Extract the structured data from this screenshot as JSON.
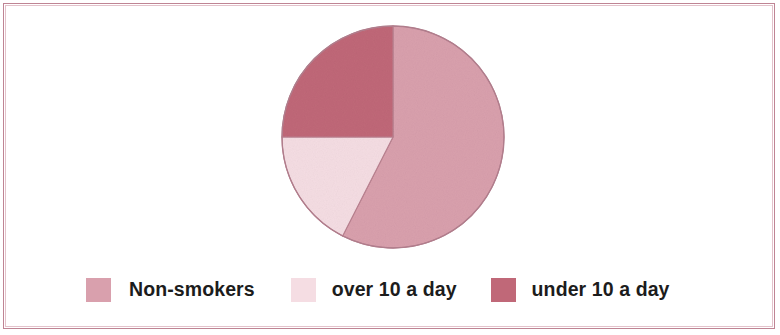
{
  "figure": {
    "border_color": "#bf8494",
    "background": "#ffffff"
  },
  "legend": {
    "items": [
      {
        "label": "Non-smokers",
        "color": "#d9a0ad",
        "swatch_name": "legend-swatch-non-smokers"
      },
      {
        "label": "over 10 a day",
        "color": "#f5dde3",
        "swatch_name": "legend-swatch-over-10-a-day"
      },
      {
        "label": "under 10 a day",
        "color": "#c06878",
        "swatch_name": "legend-swatch-under-10-a-day"
      }
    ]
  },
  "chart_data": {
    "type": "pie",
    "title": "",
    "subtitle": "",
    "xlabel": "",
    "ylabel": "",
    "categories": [
      "Non-smokers",
      "over 10 a day",
      "under 10 a day"
    ],
    "values": [
      57.5,
      17.5,
      25
    ],
    "unit": "percent",
    "colors": [
      "#d9a0ad",
      "#f5dde3",
      "#c06878"
    ],
    "slice_angles_deg": [
      207,
      63,
      90
    ],
    "start_angle_deg": 0,
    "direction": "clockwise",
    "legend_position": "bottom",
    "grid": false,
    "data_labels_shown": false,
    "annotations": []
  },
  "geometry": {
    "center_x": 112,
    "center_y": 112,
    "radius": 111,
    "stroke_color": "#b9808f"
  }
}
